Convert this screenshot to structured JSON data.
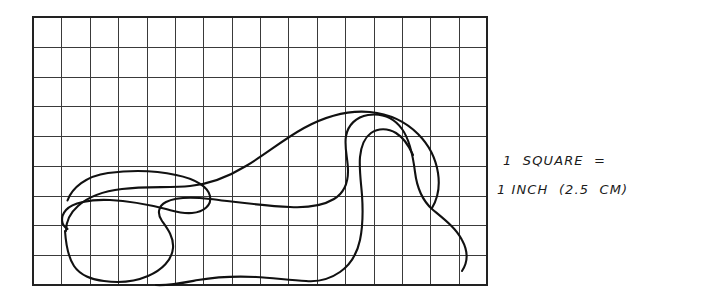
{
  "document": {
    "title": "Hand-drawn blob outline on grid paper",
    "background_color": "#ffffff",
    "ink_color": "#111111",
    "grid_color": "#3a3a3a"
  },
  "annotation": {
    "line1": "1  SQUARE  =",
    "line2": "1 INCH  (2.5  CM)",
    "full_text": "1 SQUARE = 1 INCH (2.5 CM)",
    "scale_unit_inch": "1 INCH",
    "scale_unit_metric": "2.5 CM"
  },
  "grid": {
    "columns": 16,
    "rows": 9,
    "cell_size_px": 28.4,
    "left_px": 33,
    "top_px": 17,
    "right_px": 487,
    "bottom_px": 285,
    "square_equals": "1 inch (2.5 cm)"
  },
  "chart_data": {
    "type": "line",
    "xlabel": "",
    "ylabel": "",
    "xlim": [
      0,
      16
    ],
    "ylim": [
      0,
      9
    ],
    "grid": true,
    "legend": "none",
    "categories": [],
    "values": [],
    "annotations": [
      "1 SQUARE = 1 INCH (2.5 CM)"
    ],
    "series": [
      {
        "name": "blob-outline",
        "closed": true,
        "units": "grid squares",
        "points": [
          [
            1.2,
            7.6
          ],
          [
            2.2,
            8.3
          ],
          [
            3.6,
            8.55
          ],
          [
            5.0,
            8.5
          ],
          [
            6.0,
            8.3
          ],
          [
            6.6,
            7.9
          ],
          [
            6.7,
            7.4
          ],
          [
            6.3,
            7.1
          ],
          [
            5.6,
            7.0
          ],
          [
            5.2,
            7.05
          ],
          [
            4.6,
            6.9
          ],
          [
            3.4,
            6.55
          ],
          [
            2.2,
            6.4
          ],
          [
            1.3,
            6.6
          ],
          [
            0.9,
            7.0
          ],
          [
            1.0,
            7.35
          ],
          [
            1.2,
            7.6
          ]
        ]
      },
      {
        "name": "blob-outline-main",
        "closed": true,
        "units": "grid squares",
        "points": [
          [
            2.5,
            0.25
          ],
          [
            3.4,
            0.3
          ],
          [
            4.4,
            0.55
          ],
          [
            5.0,
            1.1
          ],
          [
            5.1,
            1.75
          ],
          [
            4.7,
            2.25
          ],
          [
            4.4,
            2.7
          ],
          [
            4.6,
            3.1
          ],
          [
            5.4,
            3.25
          ],
          [
            6.6,
            3.2
          ],
          [
            8.0,
            3.0
          ],
          [
            9.4,
            2.9
          ],
          [
            10.2,
            3.05
          ],
          [
            10.9,
            3.3
          ],
          [
            11.3,
            3.1
          ],
          [
            11.4,
            2.5
          ],
          [
            11.2,
            1.8
          ],
          [
            11.3,
            1.2
          ],
          [
            11.9,
            0.85
          ],
          [
            12.9,
            0.9
          ],
          [
            13.6,
            1.4
          ],
          [
            14.0,
            2.2
          ],
          [
            14.2,
            3.3
          ],
          [
            14.6,
            4.2
          ],
          [
            15.3,
            4.9
          ],
          [
            15.7,
            5.8
          ],
          [
            15.6,
            6.7
          ],
          [
            15.0,
            7.5
          ],
          [
            14.0,
            8.1
          ],
          [
            12.8,
            8.35
          ],
          [
            11.5,
            8.2
          ],
          [
            10.3,
            7.7
          ],
          [
            9.2,
            7.0
          ],
          [
            8.2,
            6.4
          ],
          [
            7.2,
            6.0
          ],
          [
            6.2,
            5.95
          ],
          [
            5.4,
            6.2
          ],
          [
            4.6,
            6.6
          ],
          [
            3.8,
            6.6
          ],
          [
            3.2,
            6.2
          ],
          [
            2.9,
            5.4
          ],
          [
            2.7,
            4.3
          ],
          [
            2.5,
            3.0
          ],
          [
            2.3,
            1.6
          ],
          [
            2.5,
            0.25
          ]
        ]
      }
    ]
  }
}
